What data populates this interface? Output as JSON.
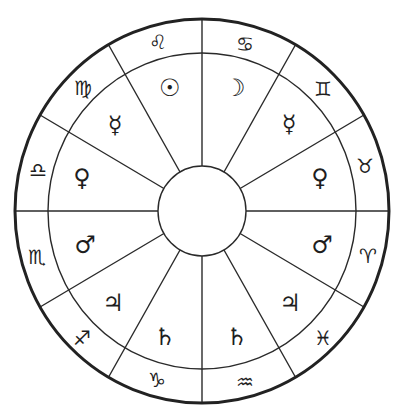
{
  "diagram": {
    "title": "",
    "colors": {
      "line": "#222222",
      "background": "#ffffff",
      "glyph": "#1e1e1e"
    },
    "geometry": {
      "center": [
        202,
        211
      ],
      "outer": {
        "rx": 187,
        "ry": 192
      },
      "middle": {
        "rx": 154,
        "ry": 158
      },
      "inner": {
        "rx": 44,
        "ry": 45
      },
      "spoke_angles_deg": [
        0,
        30,
        60,
        90,
        120,
        150,
        180,
        210,
        240,
        270,
        300,
        330
      ]
    },
    "segments": [
      {
        "sign": "Leo",
        "sign_glyph": "♌︎",
        "planet": "Sun",
        "planet_glyph": "☉︎",
        "sign_pos": [
          158,
          42
        ],
        "planet_pos": [
          170,
          88
        ]
      },
      {
        "sign": "Cancer",
        "sign_glyph": "♋︎",
        "planet": "Moon",
        "planet_glyph": "☽︎",
        "sign_pos": [
          245,
          44
        ],
        "planet_pos": [
          235,
          88
        ]
      },
      {
        "sign": "Virgo",
        "sign_glyph": "♍︎",
        "planet": "Mercury",
        "planet_glyph": "☿︎",
        "sign_pos": [
          83,
          88
        ],
        "planet_pos": [
          115,
          125
        ]
      },
      {
        "sign": "Gemini",
        "sign_glyph": "♊︎",
        "planet": "Mercury",
        "planet_glyph": "☿︎",
        "sign_pos": [
          323,
          89
        ],
        "planet_pos": [
          289,
          124
        ]
      },
      {
        "sign": "Libra",
        "sign_glyph": "♎︎",
        "planet": "Venus",
        "planet_glyph": "♀︎",
        "sign_pos": [
          38,
          170
        ],
        "planet_pos": [
          82,
          178
        ]
      },
      {
        "sign": "Taurus",
        "sign_glyph": "♉︎",
        "planet": "Venus",
        "planet_glyph": "♀︎",
        "sign_pos": [
          365,
          166
        ],
        "planet_pos": [
          320,
          178
        ]
      },
      {
        "sign": "Scorpio",
        "sign_glyph": "♏︎",
        "planet": "Mars",
        "planet_glyph": "♂︎",
        "sign_pos": [
          37,
          257
        ],
        "planet_pos": [
          85,
          245
        ]
      },
      {
        "sign": "Aries",
        "sign_glyph": "♈︎",
        "planet": "Mars",
        "planet_glyph": "♂︎",
        "sign_pos": [
          368,
          256
        ],
        "planet_pos": [
          322,
          245
        ]
      },
      {
        "sign": "Sagittarius",
        "sign_glyph": "♐︎",
        "planet": "Jupiter",
        "planet_glyph": "♃︎",
        "sign_pos": [
          82,
          338
        ],
        "planet_pos": [
          113,
          303
        ]
      },
      {
        "sign": "Pisces",
        "sign_glyph": "♓︎",
        "planet": "Jupiter",
        "planet_glyph": "♃︎",
        "sign_pos": [
          323,
          338
        ],
        "planet_pos": [
          290,
          303
        ]
      },
      {
        "sign": "Capricorn",
        "sign_glyph": "♑︎",
        "planet": "Saturn",
        "planet_glyph": "♄︎",
        "sign_pos": [
          157,
          380
        ],
        "planet_pos": [
          165,
          337
        ]
      },
      {
        "sign": "Aquarius",
        "sign_glyph": "♒︎",
        "planet": "Saturn",
        "planet_glyph": "♄︎",
        "sign_pos": [
          245,
          382
        ],
        "planet_pos": [
          237,
          337
        ]
      }
    ]
  }
}
